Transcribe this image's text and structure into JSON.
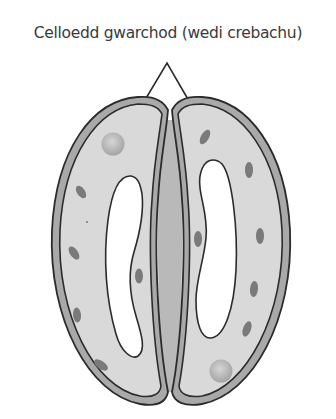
{
  "diagram": {
    "label": "Celloedd gwarchod (wedi crebachu)",
    "colors": {
      "background": "#ffffff",
      "cell_wall": "#a9a9a9",
      "cytoplasm": "#d9d9d9",
      "vacuole": "#ffffff",
      "chloroplast": "#777777",
      "nucleus": "#b8b8b8",
      "outline": "#2b2b2b",
      "pore": "#bdbdbd",
      "label_text": "#3a3a3a"
    },
    "parts": [
      "left-guard-cell",
      "right-guard-cell",
      "stomatal-pore",
      "pointer-lines"
    ]
  }
}
